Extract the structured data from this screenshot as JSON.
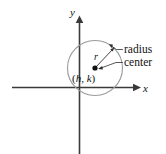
{
  "figure": {
    "name": "circle-definition-diagram",
    "background_color": "#ffffff"
  },
  "axes": {
    "x_label": "x",
    "y_label": "y",
    "axis_color": "#3a3a3a",
    "origin": {
      "x": 79,
      "y": 87
    },
    "x_axis": {
      "x1": 12,
      "y1": 87,
      "x2": 133,
      "y2": 87
    },
    "y_axis": {
      "x1": 79,
      "y1": 154,
      "x2": 79,
      "y2": 22
    }
  },
  "circle": {
    "stroke_color": "#9a9a9a",
    "center": {
      "x": 95,
      "y": 68
    },
    "radius": 27.5,
    "center_point_label": "(h, k)",
    "center_point_label_h": "h",
    "center_point_label_k": "k",
    "radius_symbol": "r",
    "center_dot_color": "#111111"
  },
  "callouts": [
    {
      "id": "radius-callout",
      "label": "radius",
      "text_x": 124,
      "text_y": 53,
      "target": {
        "x": 113.5,
        "y": 48.5
      }
    },
    {
      "id": "center-callout",
      "label": "center",
      "text_x": 124,
      "text_y": 66,
      "target": {
        "x": 98,
        "y": 68
      }
    }
  ],
  "radius_arrow": {
    "from": {
      "x": 95,
      "y": 68
    },
    "to": {
      "x": 113.5,
      "y": 48.5
    }
  }
}
